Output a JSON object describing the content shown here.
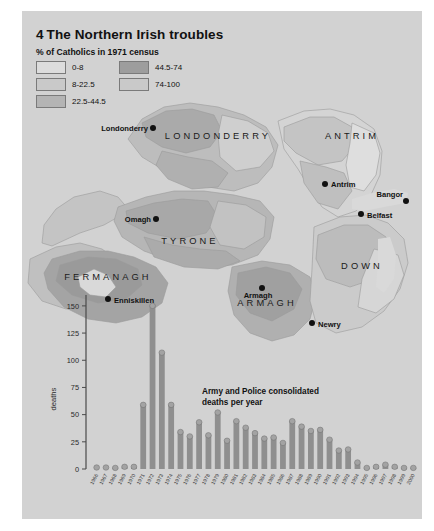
{
  "figure": {
    "number": "4",
    "title": "The Northern Irish troubles",
    "legend_title": "% of Catholics in 1971 census"
  },
  "legend": {
    "items": [
      {
        "label": "0-8",
        "color": "#dcdcdc"
      },
      {
        "label": "8-22.5",
        "color": "#c9c9c9"
      },
      {
        "label": "22.5-44.5",
        "color": "#b4b4b4"
      },
      {
        "label": "44.5-74",
        "color": "#9d9d9d"
      },
      {
        "label": "74-100",
        "color": "#8a8a8a"
      }
    ]
  },
  "map": {
    "counties": [
      {
        "name": "LONDONDERRY",
        "x": 196,
        "y": 128
      },
      {
        "name": "ANTRIM",
        "x": 330,
        "y": 128
      },
      {
        "name": "TYRONE",
        "x": 168,
        "y": 233
      },
      {
        "name": "FERMANAGH",
        "x": 86,
        "y": 269
      },
      {
        "name": "ARMAGH",
        "x": 245,
        "y": 295
      },
      {
        "name": "DOWN",
        "x": 340,
        "y": 258
      }
    ],
    "cities": [
      {
        "name": "Londonderry",
        "dot_x": 131,
        "dot_y": 117,
        "label_x": 126,
        "label_y": 120,
        "anchor": "end"
      },
      {
        "name": "Antrim",
        "dot_x": 303,
        "dot_y": 173,
        "label_x": 309,
        "label_y": 176,
        "anchor": "start"
      },
      {
        "name": "Bangor",
        "dot_x": 384,
        "dot_y": 190,
        "label_x": 381,
        "label_y": 186,
        "anchor": "end"
      },
      {
        "name": "Belfast",
        "dot_x": 339,
        "dot_y": 203,
        "label_x": 345,
        "label_y": 207,
        "anchor": "start"
      },
      {
        "name": "Omagh",
        "dot_x": 134,
        "dot_y": 208,
        "label_x": 129,
        "label_y": 211,
        "anchor": "end"
      },
      {
        "name": "Enniskillen",
        "dot_x": 86,
        "dot_y": 288,
        "label_x": 92,
        "label_y": 292,
        "anchor": "start"
      },
      {
        "name": "Armagh",
        "dot_x": 240,
        "dot_y": 277,
        "label_x": 236,
        "label_y": 287,
        "anchor": "middle"
      },
      {
        "name": "Newry",
        "dot_x": 290,
        "dot_y": 312,
        "label_x": 296,
        "label_y": 316,
        "anchor": "start"
      }
    ]
  },
  "chart_data": {
    "type": "bar",
    "xlabel": "",
    "ylabel": "deaths",
    "ylim": [
      0,
      160
    ],
    "yticks": [
      0,
      25,
      50,
      75,
      100,
      125,
      150
    ],
    "grid": false,
    "categories": [
      "1966",
      "1967",
      "1968",
      "1969",
      "1970",
      "1971",
      "1972",
      "1973",
      "1974",
      "1975",
      "1976",
      "1977",
      "1978",
      "1979",
      "1980",
      "1981",
      "1982",
      "1983",
      "1984",
      "1985",
      "1986",
      "1987",
      "1988",
      "1989",
      "1990",
      "1991",
      "1992",
      "1993",
      "1994",
      "1995",
      "1996",
      "1997",
      "1998",
      "1999",
      "2000"
    ],
    "values": [
      0,
      0,
      1,
      2,
      2,
      59,
      150,
      107,
      59,
      34,
      30,
      43,
      31,
      52,
      26,
      44,
      38,
      33,
      28,
      29,
      24,
      44,
      39,
      35,
      36,
      27,
      17,
      18,
      6,
      1,
      2,
      4,
      2,
      1,
      1
    ],
    "annotation": "Army and Police consolidated deaths per year"
  },
  "colors": {
    "plate": "#d2d2d2",
    "bar": "#8f8f8f",
    "axis": "#4a4a4a",
    "sea": "#d9d9d9"
  }
}
